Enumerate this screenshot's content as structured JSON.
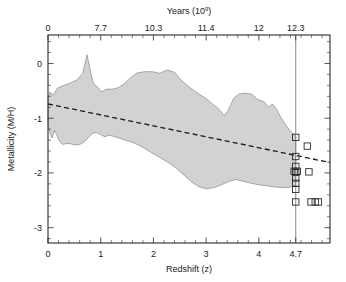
{
  "figure": {
    "background_color": "#ffffff",
    "envelope_fill": "#d2d2d2",
    "envelope_stroke": "#8a8a8a",
    "line_color": "#1a1a1a",
    "vline_color": "#7d7d7d"
  },
  "chart_data": {
    "type": "scatter",
    "title": "",
    "xlabel": "Redshift (z)",
    "ylabel": "Metallicity (M/H)",
    "top_axis_label": "Years (10⁹)",
    "top_axis_label_base": "Years (10",
    "top_axis_label_exp": "9",
    "top_axis_label_close": ")",
    "xlim": [
      0,
      5.35
    ],
    "ylim": [
      -3.28,
      0.52
    ],
    "grid": false,
    "legend": null,
    "legend_position": "none",
    "x_ticks": [
      0,
      1,
      2,
      3,
      4,
      4.7
    ],
    "x_tick_labels": [
      "0",
      "1",
      "2",
      "3",
      "4",
      "4.7"
    ],
    "y_ticks": [
      0,
      -1,
      -2,
      -3
    ],
    "y_tick_labels": [
      "0",
      "-1",
      "-2",
      "-3"
    ],
    "top_ticks": [
      0,
      1,
      2,
      3,
      4,
      4.7
    ],
    "top_tick_labels": [
      "0",
      "7.7",
      "10.3",
      "11.4",
      "12",
      "12.3"
    ],
    "top_tick_values_gyr": [
      0,
      7.7,
      10.3,
      11.4,
      12,
      12.3
    ],
    "annotations": [
      {
        "name": "redshift-cut-line",
        "type": "vline",
        "x": 4.7,
        "style": "solid",
        "color": "#7d7d7d"
      }
    ],
    "series": [
      {
        "name": "Metallicity envelope (shaded region)",
        "type": "area",
        "fill": "#d2d2d2",
        "polygon": [
          [
            0.0,
            -0.62
          ],
          [
            0.04,
            -0.52
          ],
          [
            0.1,
            -0.58
          ],
          [
            0.18,
            -0.45
          ],
          [
            0.3,
            -0.4
          ],
          [
            0.42,
            -0.36
          ],
          [
            0.55,
            -0.3
          ],
          [
            0.66,
            -0.18
          ],
          [
            0.74,
            0.16
          ],
          [
            0.8,
            -0.12
          ],
          [
            0.86,
            -0.36
          ],
          [
            0.95,
            -0.44
          ],
          [
            1.02,
            -0.52
          ],
          [
            1.1,
            -0.47
          ],
          [
            1.22,
            -0.47
          ],
          [
            1.34,
            -0.44
          ],
          [
            1.46,
            -0.36
          ],
          [
            1.58,
            -0.25
          ],
          [
            1.7,
            -0.17
          ],
          [
            1.84,
            -0.15
          ],
          [
            1.98,
            -0.15
          ],
          [
            2.12,
            -0.18
          ],
          [
            2.26,
            -0.12
          ],
          [
            2.4,
            -0.16
          ],
          [
            2.52,
            -0.3
          ],
          [
            2.64,
            -0.4
          ],
          [
            2.76,
            -0.49
          ],
          [
            2.88,
            -0.57
          ],
          [
            3.0,
            -0.64
          ],
          [
            3.12,
            -0.74
          ],
          [
            3.24,
            -0.83
          ],
          [
            3.34,
            -0.95
          ],
          [
            3.42,
            -0.86
          ],
          [
            3.52,
            -0.64
          ],
          [
            3.62,
            -0.56
          ],
          [
            3.74,
            -0.54
          ],
          [
            3.86,
            -0.56
          ],
          [
            3.98,
            -0.66
          ],
          [
            4.1,
            -0.7
          ],
          [
            4.18,
            -0.8
          ],
          [
            4.26,
            -0.74
          ],
          [
            4.34,
            -0.84
          ],
          [
            4.42,
            -0.99
          ],
          [
            4.52,
            -1.14
          ],
          [
            4.62,
            -1.26
          ],
          [
            4.7,
            -1.33
          ],
          [
            4.7,
            -2.22
          ],
          [
            4.6,
            -2.26
          ],
          [
            4.48,
            -2.27
          ],
          [
            4.34,
            -2.26
          ],
          [
            4.18,
            -2.24
          ],
          [
            4.02,
            -2.22
          ],
          [
            3.86,
            -2.19
          ],
          [
            3.7,
            -2.15
          ],
          [
            3.56,
            -2.12
          ],
          [
            3.42,
            -2.16
          ],
          [
            3.28,
            -2.22
          ],
          [
            3.14,
            -2.27
          ],
          [
            3.0,
            -2.29
          ],
          [
            2.86,
            -2.25
          ],
          [
            2.72,
            -2.16
          ],
          [
            2.58,
            -2.04
          ],
          [
            2.44,
            -1.92
          ],
          [
            2.3,
            -1.82
          ],
          [
            2.16,
            -1.74
          ],
          [
            2.02,
            -1.66
          ],
          [
            1.88,
            -1.58
          ],
          [
            1.74,
            -1.5
          ],
          [
            1.6,
            -1.44
          ],
          [
            1.46,
            -1.4
          ],
          [
            1.34,
            -1.36
          ],
          [
            1.24,
            -1.33
          ],
          [
            1.16,
            -1.31
          ],
          [
            1.08,
            -1.34
          ],
          [
            1.0,
            -1.3
          ],
          [
            0.92,
            -1.26
          ],
          [
            0.84,
            -1.28
          ],
          [
            0.76,
            -1.36
          ],
          [
            0.68,
            -1.44
          ],
          [
            0.6,
            -1.48
          ],
          [
            0.52,
            -1.49
          ],
          [
            0.44,
            -1.47
          ],
          [
            0.36,
            -1.46
          ],
          [
            0.28,
            -1.48
          ],
          [
            0.22,
            -1.42
          ],
          [
            0.16,
            -1.3
          ],
          [
            0.12,
            -1.22
          ],
          [
            0.08,
            -1.36
          ],
          [
            0.04,
            -1.28
          ],
          [
            0.0,
            -1.12
          ]
        ]
      },
      {
        "name": "Linear fit (dashed)",
        "type": "line",
        "style": "dashed",
        "x": [
          0.0,
          5.35
        ],
        "y": [
          -0.74,
          -1.81
        ]
      },
      {
        "name": "Individual measurements (open squares)",
        "type": "scatter",
        "marker": "open-square",
        "points": [
          {
            "x": 4.7,
            "y": -1.35
          },
          {
            "x": 4.92,
            "y": -1.51
          },
          {
            "x": 4.7,
            "y": -1.7
          },
          {
            "x": 4.7,
            "y": -1.88
          },
          {
            "x": 4.73,
            "y": -1.97
          },
          {
            "x": 4.67,
            "y": -1.97
          },
          {
            "x": 4.7,
            "y": -1.99
          },
          {
            "x": 4.95,
            "y": -1.98
          },
          {
            "x": 4.7,
            "y": -2.09
          },
          {
            "x": 4.7,
            "y": -2.19
          },
          {
            "x": 4.7,
            "y": -2.3
          },
          {
            "x": 4.7,
            "y": -2.53
          },
          {
            "x": 4.99,
            "y": -2.53
          },
          {
            "x": 5.07,
            "y": -2.53
          },
          {
            "x": 5.13,
            "y": -2.53
          }
        ]
      }
    ]
  }
}
